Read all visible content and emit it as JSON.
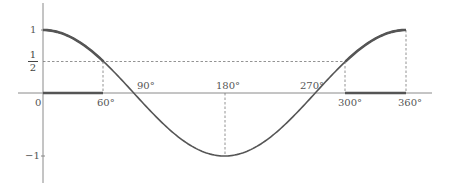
{
  "figure": {
    "title": ""
  },
  "chart_data": {
    "type": "line",
    "function": "cos(x)",
    "x_unit": "degrees",
    "xlim": [
      0,
      360
    ],
    "ylim": [
      -1,
      1
    ],
    "x": [
      0,
      30,
      60,
      90,
      120,
      150,
      180,
      210,
      240,
      270,
      300,
      330,
      360
    ],
    "y": [
      1,
      0.866,
      0.5,
      0,
      -0.5,
      -0.866,
      -1,
      -0.866,
      -0.5,
      0,
      0.5,
      0.866,
      1
    ],
    "x_tick_labels": [
      "0",
      "60°",
      "90°",
      "180°",
      "270°",
      "300°",
      "360°"
    ],
    "y_tick_labels": [
      "1",
      "1/2",
      "-1"
    ],
    "reference_lines": [
      {
        "type": "horizontal-dashed",
        "y": 0.5,
        "from_x": 0,
        "to_x": 300
      },
      {
        "type": "vertical-dashed",
        "x": 60,
        "from_y": 0,
        "to_y": 0.5
      },
      {
        "type": "vertical-dashed",
        "x": 180,
        "from_y": 0,
        "to_y": -1
      },
      {
        "type": "vertical-dashed",
        "x": 300,
        "from_y": 0,
        "to_y": 0.5
      },
      {
        "type": "vertical-dashed",
        "x": 360,
        "from_y": 0,
        "to_y": 1
      }
    ],
    "highlighted_intervals": [
      [
        0,
        60
      ],
      [
        300,
        360
      ]
    ],
    "grid": false,
    "legend": null
  },
  "labels": {
    "origin": "0",
    "x60": "60°",
    "x90": "90°",
    "x180": "180°",
    "x270": "270°",
    "x300": "300°",
    "x360": "360°",
    "y1": "1",
    "yhalf_num": "1",
    "yhalf_den": "2",
    "yneg1": "−1"
  },
  "colors": {
    "curve": "#555555",
    "axis": "#888888",
    "dashed": "#777777",
    "highlight": "#555555"
  }
}
